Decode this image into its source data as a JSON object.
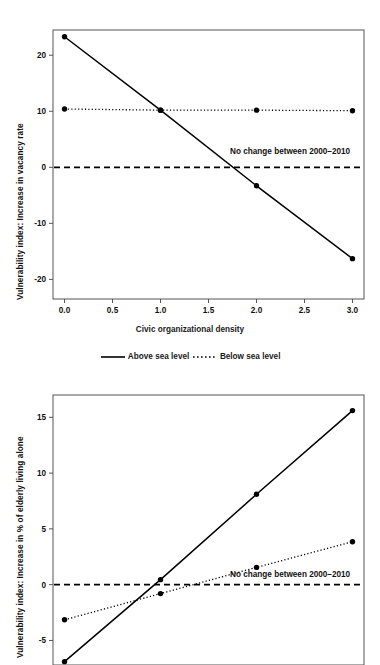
{
  "chart_data": [
    {
      "id": "vacancy-rate",
      "type": "line",
      "title": "",
      "xlabel": "Civic organizational density",
      "ylabel": "Vulnerability index: Increase in vacancy rate",
      "xlim": [
        -0.12,
        3.12
      ],
      "ylim": [
        -23.5,
        24.5
      ],
      "xticks": [
        0.0,
        0.5,
        1.0,
        1.5,
        2.0,
        2.5,
        3.0
      ],
      "xticklabels": [
        "0.0",
        "0.5",
        "1.0",
        "1.5",
        "2.0",
        "2.5",
        "3.0"
      ],
      "yticks": [
        20,
        10,
        0,
        -10,
        -20
      ],
      "yticklabels": [
        "20",
        "10",
        "0",
        "-10",
        "-20"
      ],
      "grid": false,
      "legend_position": "below-axes",
      "annotations": [
        {
          "text": "No change between 2000–2010",
          "x": 2.35,
          "y": 2.4
        }
      ],
      "reference_line": {
        "y": 0,
        "style": "dashed"
      },
      "series": [
        {
          "name": "Above sea level",
          "style": "solid",
          "marker": "circle",
          "x": [
            0.0,
            1.0,
            2.0,
            3.0
          ],
          "values": [
            23.3,
            10.2,
            -3.3,
            -16.3
          ]
        },
        {
          "name": "Below sea level",
          "style": "dotted",
          "marker": "circle",
          "x": [
            0.0,
            1.0,
            2.0,
            3.0
          ],
          "values": [
            10.4,
            10.2,
            10.2,
            10.1
          ]
        }
      ]
    },
    {
      "id": "elderly-living-alone",
      "type": "line",
      "title": "",
      "xlabel": "",
      "ylabel": "Vulnerability index: Increase in % of elderly living alone",
      "xlim": [
        -0.12,
        3.12
      ],
      "ylim": [
        -7.2,
        17.0
      ],
      "xticks": [
        0.0,
        1.0,
        2.0,
        3.0
      ],
      "xticklabels": [
        "",
        "",
        "",
        ""
      ],
      "yticks": [
        15,
        10,
        5,
        0,
        -5
      ],
      "yticklabels": [
        "15",
        "10",
        "5",
        "0",
        "-5"
      ],
      "grid": false,
      "legend_position": "none",
      "annotations": [
        {
          "text": "No change between 2000–2010",
          "x": 2.35,
          "y": 0.72
        }
      ],
      "reference_line": {
        "y": 0,
        "style": "dashed"
      },
      "series": [
        {
          "name": "Above sea level",
          "style": "solid",
          "marker": "circle",
          "x": [
            0.0,
            1.0,
            2.0,
            3.0
          ],
          "values": [
            -6.9,
            0.45,
            8.1,
            15.6
          ]
        },
        {
          "name": "Below sea level",
          "style": "dotted",
          "marker": "circle",
          "x": [
            0.0,
            1.0,
            2.0,
            3.0
          ],
          "values": [
            -3.15,
            -0.8,
            1.55,
            3.85
          ]
        }
      ]
    }
  ],
  "legend": {
    "items": [
      {
        "label": "Above sea level",
        "style": "solid"
      },
      {
        "label": "Below sea level",
        "style": "dotted"
      }
    ]
  },
  "colors": {
    "line": "#000000",
    "axis": "#555555",
    "text": "#111111",
    "background": "#ffffff"
  }
}
